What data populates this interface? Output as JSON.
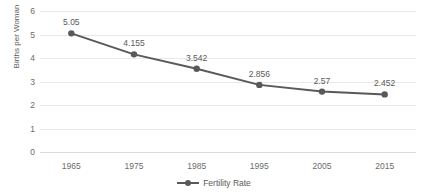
{
  "chart_data": {
    "type": "line",
    "title": "",
    "xlabel": "",
    "ylabel": "Births per Woman",
    "categories": [
      "1965",
      "1975",
      "1985",
      "1995",
      "2005",
      "2015"
    ],
    "x": [
      1965,
      1975,
      1985,
      1995,
      2005,
      2015
    ],
    "series": [
      {
        "name": "Fertility Rate",
        "values": [
          5.05,
          4.155,
          3.542,
          2.856,
          2.57,
          2.452
        ],
        "labels": [
          "5.05",
          "4.155",
          "3.542",
          "2.856",
          "2.57",
          "2.452"
        ],
        "color": "#595959",
        "marker": "circle",
        "show_data_labels": true
      }
    ],
    "ylim": [
      0,
      6
    ],
    "yticks": [
      0,
      1,
      2,
      3,
      4,
      5,
      6
    ],
    "ytick_labels": [
      "0",
      "1",
      "2",
      "3",
      "4",
      "5",
      "6"
    ],
    "grid": true,
    "grid_axis": "y",
    "grid_color": "#e8e8e8",
    "legend": true,
    "legend_position": "bottom",
    "legend_entries": [
      "Fertility Rate"
    ],
    "background": "#ffffff"
  },
  "axes": {
    "y_title": "Births per Woman"
  },
  "legend": {
    "entry_label": "Fertility Rate"
  },
  "title": {
    "text": ""
  }
}
